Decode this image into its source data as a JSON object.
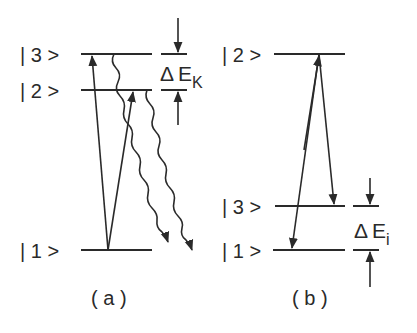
{
  "panel_a": {
    "caption": "( a )",
    "levels": [
      {
        "label": "| 3 >",
        "state": "3"
      },
      {
        "label": "| 2 >",
        "state": "2"
      },
      {
        "label": "| 1 >",
        "state": "1"
      }
    ],
    "gap_label": {
      "delta": "Δ",
      "symbol": "E",
      "subscript": "K"
    },
    "transitions": [
      {
        "from": "1",
        "to": "3",
        "type": "absorption"
      },
      {
        "from": "1",
        "to": "2",
        "type": "absorption"
      },
      {
        "from": "3",
        "to": "1",
        "type": "wavy-decay"
      },
      {
        "from": "2",
        "to": "1",
        "type": "wavy-decay"
      }
    ]
  },
  "panel_b": {
    "caption": "( b )",
    "levels": [
      {
        "label": "| 2 >",
        "state": "2"
      },
      {
        "label": "| 3 >",
        "state": "3"
      },
      {
        "label": "| 1 >",
        "state": "1"
      }
    ],
    "gap_label": {
      "delta": "Δ",
      "symbol": "E",
      "subscript": "i"
    },
    "transitions": [
      {
        "from": "1",
        "to": "2",
        "type": "excitation"
      },
      {
        "from": "2",
        "to": "1",
        "type": "stimulated"
      },
      {
        "from": "2",
        "to": "3",
        "type": "stimulated"
      }
    ]
  },
  "colors": {
    "ink": "#2a2a2a",
    "background": "#ffffff"
  }
}
